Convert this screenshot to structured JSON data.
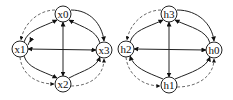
{
  "graphs": [
    {
      "name": "graph-x",
      "nodes": [
        {
          "id": "x0",
          "label": "x0",
          "cx": 63,
          "cy": 14
        },
        {
          "id": "x1",
          "label": "x1",
          "cx": 20,
          "cy": 49
        },
        {
          "id": "x3",
          "label": "x3",
          "cx": 104,
          "cy": 50
        },
        {
          "id": "x2",
          "label": "x2",
          "cx": 63,
          "cy": 84
        }
      ]
    },
    {
      "name": "graph-h",
      "nodes": [
        {
          "id": "h3",
          "label": "h3",
          "cx": 169,
          "cy": 14
        },
        {
          "id": "h2",
          "label": "h2",
          "cx": 126,
          "cy": 49
        },
        {
          "id": "h0",
          "label": "h0",
          "cx": 214,
          "cy": 50
        },
        {
          "id": "h1",
          "label": "h1",
          "cx": 169,
          "cy": 85
        }
      ]
    }
  ],
  "colors": {
    "stroke": "#222222",
    "dashed": "#444444",
    "background": "#ffffff"
  }
}
